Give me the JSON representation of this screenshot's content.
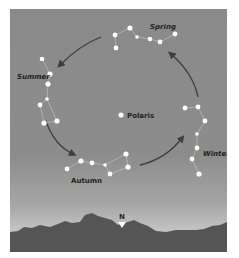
{
  "diagram": {
    "center_label": "Polaris",
    "seasons": [
      {
        "name": "Spring",
        "position": "top"
      },
      {
        "name": "Summer",
        "position": "left"
      },
      {
        "name": "Autumn",
        "position": "bottom"
      },
      {
        "name": "Winter",
        "position": "right"
      }
    ],
    "compass": {
      "label": "N",
      "marker": "down-triangle-icon"
    },
    "rotation_direction": "counterclockwise",
    "colors": {
      "sky_top": "#8a8a8a",
      "sky_horizon": "#d8d8d8",
      "ground": "#555555",
      "star": "#ffffff",
      "arrow": "#3e3e3e",
      "line": "#c8c8c8"
    }
  }
}
